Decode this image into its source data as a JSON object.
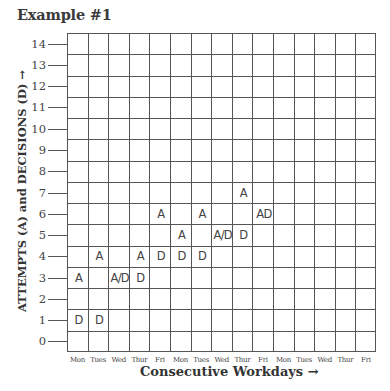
{
  "chart_data": {
    "type": "scatter",
    "title": "Example #1",
    "xlabel": "Consecutive Workdays →",
    "ylabel": "ATTEMPTS (A) and DECISIONS (D) →",
    "y_ticks": [
      "14",
      "13",
      "12",
      "11",
      "10",
      "9",
      "8",
      "7",
      "6",
      "5",
      "4",
      "3",
      "2",
      "1",
      "0"
    ],
    "ylim": [
      0,
      14
    ],
    "x_categories": [
      "Mon",
      "Tues",
      "Wed",
      "Thur",
      "Fri",
      "Mon",
      "Tues",
      "Wed",
      "Thur",
      "Fri",
      "Mon",
      "Tues",
      "Wed",
      "Thur",
      "Fri"
    ],
    "grid": true,
    "legend": null,
    "series": [
      {
        "name": "Attempts (A)",
        "values": [
          3,
          4,
          3,
          4,
          6,
          5,
          6,
          5,
          7,
          6,
          null,
          null,
          null,
          null,
          null
        ]
      },
      {
        "name": "Decisions (D)",
        "values": [
          1,
          1,
          3,
          3,
          4,
          4,
          4,
          5,
          5,
          6,
          null,
          null,
          null,
          null,
          null
        ]
      }
    ],
    "marks": [
      {
        "col": 0,
        "y": 3,
        "label": "A"
      },
      {
        "col": 0,
        "y": 1,
        "label": "D"
      },
      {
        "col": 1,
        "y": 4,
        "label": "A"
      },
      {
        "col": 1,
        "y": 1,
        "label": "D"
      },
      {
        "col": 2,
        "y": 3,
        "label": "A/D"
      },
      {
        "col": 3,
        "y": 4,
        "label": "A"
      },
      {
        "col": 3,
        "y": 3,
        "label": "D"
      },
      {
        "col": 4,
        "y": 6,
        "label": "A"
      },
      {
        "col": 4,
        "y": 4,
        "label": "D"
      },
      {
        "col": 5,
        "y": 5,
        "label": "A"
      },
      {
        "col": 5,
        "y": 4,
        "label": "D"
      },
      {
        "col": 6,
        "y": 6,
        "label": "A"
      },
      {
        "col": 6,
        "y": 4,
        "label": "D"
      },
      {
        "col": 7,
        "y": 5,
        "label": "A/D"
      },
      {
        "col": 8,
        "y": 7,
        "label": "A"
      },
      {
        "col": 8,
        "y": 5,
        "label": "D"
      },
      {
        "col": 9,
        "y": 6,
        "label": "AD"
      }
    ]
  }
}
